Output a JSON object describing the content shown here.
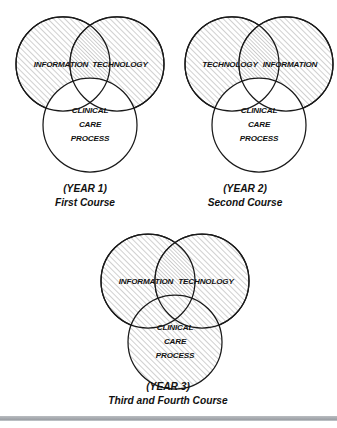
{
  "figure": {
    "background_color": "#ffffff",
    "stroke_color": "#1a1a1a",
    "hatch_color": "#8c8c8c",
    "rule_color": "#a7abb0",
    "diagrams": [
      {
        "id": "year-1",
        "left_circle_label": "INFORMATION",
        "right_circle_label": "TECHNOLOGY",
        "bottom_circle_line1": "CLINICAL",
        "bottom_circle_line2": "CARE",
        "bottom_circle_line3": "PROCESS",
        "bottom_circle_filled": false,
        "caption_year": "(YEAR 1)",
        "caption_course": "First Course"
      },
      {
        "id": "year-2",
        "left_circle_label": "TECHNOLOGY",
        "right_circle_label": "INFORMATION",
        "bottom_circle_line1": "CLINICAL",
        "bottom_circle_line2": "CARE",
        "bottom_circle_line3": "PROCESS",
        "bottom_circle_filled": false,
        "caption_year": "(YEAR 2)",
        "caption_course": "Second Course"
      },
      {
        "id": "year-3",
        "left_circle_label": "INFORMATION",
        "right_circle_label": "TECHNOLOGY",
        "bottom_circle_line1": "CLINICAL",
        "bottom_circle_line2": "CARE",
        "bottom_circle_line3": "PROCESS",
        "bottom_circle_filled": true,
        "caption_year": "(YEAR 3)",
        "caption_course": "Third and Fourth Course"
      }
    ]
  }
}
